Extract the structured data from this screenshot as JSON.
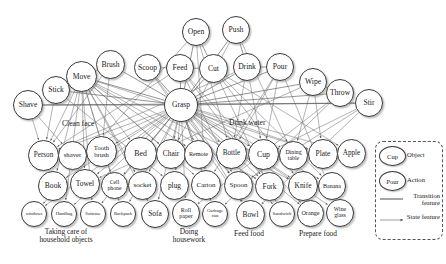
{
  "figure": {
    "title": "",
    "kind": "action-object bipartite graph"
  },
  "actions": [
    {
      "id": "open",
      "label": "Open",
      "x": 182,
      "y": 18,
      "d": 28
    },
    {
      "id": "push",
      "label": "Push",
      "x": 222,
      "y": 16,
      "d": 28
    },
    {
      "id": "brush",
      "label": "Brush",
      "x": 96,
      "y": 50,
      "d": 29
    },
    {
      "id": "scoop",
      "label": "Scoop",
      "x": 134,
      "y": 54,
      "d": 27
    },
    {
      "id": "feed",
      "label": "Feed",
      "x": 166,
      "y": 54,
      "d": 28
    },
    {
      "id": "cut",
      "label": "Cut",
      "x": 199,
      "y": 54,
      "d": 29
    },
    {
      "id": "drink",
      "label": "Drink",
      "x": 233,
      "y": 53,
      "d": 28
    },
    {
      "id": "pour",
      "label": "Pour",
      "x": 266,
      "y": 53,
      "d": 28
    },
    {
      "id": "move",
      "label": "Move",
      "x": 66,
      "y": 61,
      "d": 31
    },
    {
      "id": "wipe",
      "label": "Wipe",
      "x": 299,
      "y": 68,
      "d": 28
    },
    {
      "id": "stick",
      "label": "Stick",
      "x": 42,
      "y": 76,
      "d": 28
    },
    {
      "id": "throw",
      "label": "Throw",
      "x": 326,
      "y": 79,
      "d": 28
    },
    {
      "id": "shave",
      "label": "Shave",
      "x": 13,
      "y": 90,
      "d": 30
    },
    {
      "id": "stir",
      "label": "Stir",
      "x": 355,
      "y": 89,
      "d": 28
    },
    {
      "id": "grasp",
      "label": "Grasp",
      "x": 164,
      "y": 88,
      "d": 34
    }
  ],
  "objects_row1": [
    {
      "id": "person",
      "label": "Person",
      "x": 28,
      "y": 140,
      "d": 31,
      "fs": 7.2
    },
    {
      "id": "shaver",
      "label": "shaver",
      "x": 58,
      "y": 141,
      "d": 29,
      "fs": 6.8
    },
    {
      "id": "toothbrush",
      "label": "Tooth brush",
      "x": 86,
      "y": 136,
      "d": 31,
      "fs": 6.6
    },
    {
      "id": "bed",
      "label": "Bed",
      "x": 124,
      "y": 137,
      "d": 33,
      "fs": 7.8
    },
    {
      "id": "chair",
      "label": "Chair",
      "x": 156,
      "y": 139,
      "d": 30,
      "fs": 7.4
    },
    {
      "id": "remote",
      "label": "Remote",
      "x": 184,
      "y": 140,
      "d": 29,
      "fs": 6.2
    },
    {
      "id": "bottle",
      "label": "Bottle",
      "x": 216,
      "y": 138,
      "d": 31,
      "fs": 7.2
    },
    {
      "id": "cup",
      "label": "Cup",
      "x": 248,
      "y": 139,
      "d": 31,
      "fs": 7.8
    },
    {
      "id": "diningtable",
      "label": "Dining table",
      "x": 279,
      "y": 141,
      "d": 29,
      "fs": 5.8
    },
    {
      "id": "plate",
      "label": "Plate",
      "x": 308,
      "y": 139,
      "d": 30,
      "fs": 7.4
    },
    {
      "id": "apple",
      "label": "Apple",
      "x": 337,
      "y": 139,
      "d": 29,
      "fs": 7.2
    }
  ],
  "objects_row2": [
    {
      "id": "book",
      "label": "Book",
      "x": 38,
      "y": 171,
      "d": 30,
      "fs": 7.6
    },
    {
      "id": "towel",
      "label": "Towel",
      "x": 70,
      "y": 169,
      "d": 30,
      "fs": 7.4
    },
    {
      "id": "cellphone",
      "label": "Cell phone",
      "x": 101,
      "y": 172,
      "d": 27,
      "fs": 5.8
    },
    {
      "id": "socket",
      "label": "socket",
      "x": 128,
      "y": 171,
      "d": 29,
      "fs": 7.0
    },
    {
      "id": "plug",
      "label": "plug",
      "x": 160,
      "y": 171,
      "d": 29,
      "fs": 7.4
    },
    {
      "id": "carton",
      "label": "Carton",
      "x": 191,
      "y": 170,
      "d": 30,
      "fs": 7.0
    },
    {
      "id": "spoon",
      "label": "Spoon",
      "x": 224,
      "y": 171,
      "d": 29,
      "fs": 7.0
    },
    {
      "id": "fork",
      "label": "Fork",
      "x": 255,
      "y": 172,
      "d": 29,
      "fs": 7.4
    },
    {
      "id": "knife",
      "label": "Knife",
      "x": 288,
      "y": 171,
      "d": 30,
      "fs": 7.4
    },
    {
      "id": "banana",
      "label": "Banana",
      "x": 318,
      "y": 172,
      "d": 28,
      "fs": 6.0
    }
  ],
  "objects_row3": [
    {
      "id": "windows",
      "label": "windows",
      "x": 21,
      "y": 201,
      "d": 26,
      "fs": 4.6
    },
    {
      "id": "handbag",
      "label": "Handbag",
      "x": 51,
      "y": 201,
      "d": 26,
      "fs": 4.6
    },
    {
      "id": "suitcase",
      "label": "Suitcase",
      "x": 80,
      "y": 201,
      "d": 26,
      "fs": 4.6
    },
    {
      "id": "backpack",
      "label": "Backpack",
      "x": 110,
      "y": 201,
      "d": 26,
      "fs": 4.6
    },
    {
      "id": "sofa",
      "label": "Sofa",
      "x": 141,
      "y": 200,
      "d": 28,
      "fs": 7.4
    },
    {
      "id": "rollpaper",
      "label": "Roll paper",
      "x": 172,
      "y": 199,
      "d": 28,
      "fs": 6.0
    },
    {
      "id": "garbagecan",
      "label": "Garbage can",
      "x": 202,
      "y": 201,
      "d": 26,
      "fs": 4.8
    },
    {
      "id": "bowl",
      "label": "Bowl",
      "x": 236,
      "y": 200,
      "d": 29,
      "fs": 7.4
    },
    {
      "id": "sandwich",
      "label": "Sandwich",
      "x": 269,
      "y": 201,
      "d": 26,
      "fs": 4.8
    },
    {
      "id": "orange",
      "label": "Orange",
      "x": 297,
      "y": 200,
      "d": 27,
      "fs": 6.2
    },
    {
      "id": "wineglass",
      "label": "Wine glass",
      "x": 326,
      "y": 199,
      "d": 28,
      "fs": 5.8
    }
  ],
  "feature_labels": [
    {
      "id": "clean-face",
      "label": "Clean face",
      "x": 62,
      "y": 119
    },
    {
      "id": "drink-water",
      "label": "Drink water",
      "x": 229,
      "y": 118
    }
  ],
  "group_labels": [
    {
      "id": "household",
      "label": "Taking care of\nhousehold objects",
      "x": 14,
      "y": 228,
      "w": 104
    },
    {
      "id": "housework",
      "label": "Doing\nhousework",
      "x": 161,
      "y": 228,
      "w": 56
    },
    {
      "id": "feedfood",
      "label": "Feed food",
      "x": 224,
      "y": 230,
      "w": 50
    },
    {
      "id": "preparefood",
      "label": "Prepare food",
      "x": 288,
      "y": 230,
      "w": 60
    }
  ],
  "legend": {
    "object_node_label": "Cup",
    "object_text": "Object",
    "action_node_label": "Pour",
    "action_text": "Action",
    "transition_text": "Transition feature",
    "state_text": "State feature"
  },
  "chart_data": {
    "type": "diagram-graph",
    "title": "",
    "action_nodes": [
      "Open",
      "Push",
      "Brush",
      "Scoop",
      "Feed",
      "Cut",
      "Drink",
      "Pour",
      "Move",
      "Wipe",
      "Stick",
      "Throw",
      "Shave",
      "Stir",
      "Grasp"
    ],
    "object_nodes": [
      "Person",
      "shaver",
      "Tooth brush",
      "Bed",
      "Chair",
      "Remote",
      "Bottle",
      "Cup",
      "Dining table",
      "Plate",
      "Apple",
      "Book",
      "Towel",
      "Cell phone",
      "socket",
      "plug",
      "Carton",
      "Spoon",
      "Fork",
      "Knife",
      "Banana",
      "windows",
      "Handbag",
      "Suitcase",
      "Backpack",
      "Sofa",
      "Roll paper",
      "Garbage can",
      "Bowl",
      "Sandwich",
      "Orange",
      "Wine glass"
    ],
    "hub_node": "Grasp",
    "transition_pairs": [
      [
        "Open",
        "Cut"
      ],
      [
        "Push",
        "Drink"
      ],
      [
        "Scoop",
        "Feed"
      ],
      [
        "Feed",
        "Cut"
      ],
      [
        "Drink",
        "Pour"
      ],
      [
        "Move",
        "Brush"
      ],
      [
        "Stick",
        "Move"
      ],
      [
        "Shave",
        "Stir"
      ],
      [
        "Wipe",
        "Throw"
      ]
    ],
    "edge_types": {
      "transition feature": "solid line",
      "state feature": "arrow line"
    }
  }
}
